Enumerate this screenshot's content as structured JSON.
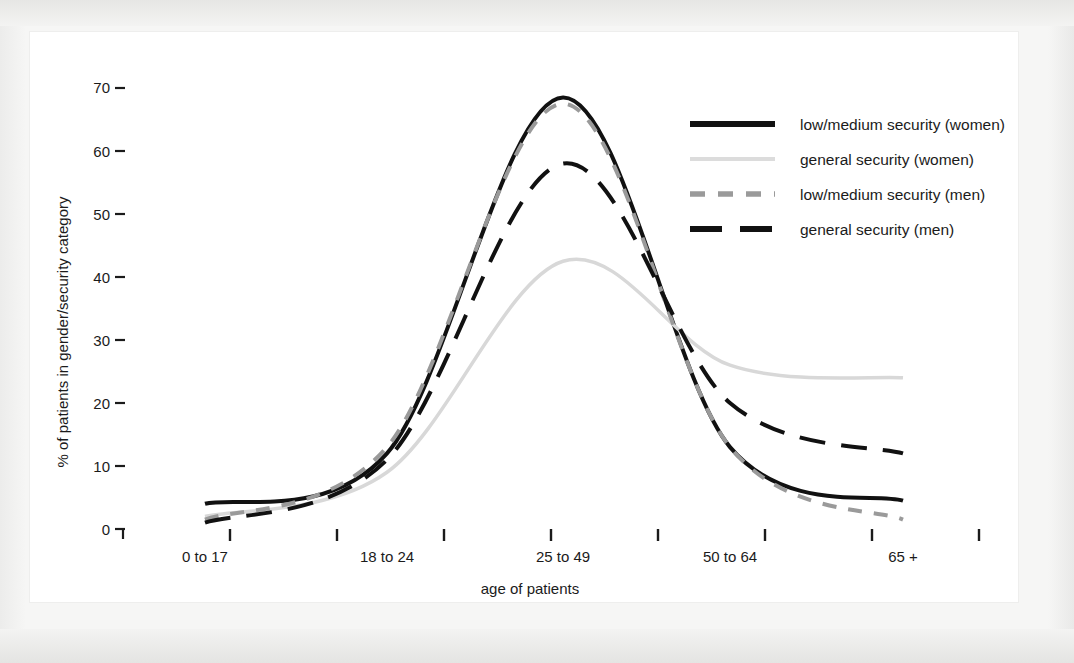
{
  "chart_data": {
    "type": "line",
    "title": "",
    "xlabel": "age of patients",
    "ylabel": "% of patients in gender/security category",
    "categories": [
      "0 to 17",
      "18 to 24",
      "25 to 49",
      "50 to 64",
      "65 +"
    ],
    "ylim": [
      0,
      72
    ],
    "yticks": [
      0,
      10,
      20,
      30,
      40,
      50,
      60,
      70
    ],
    "ytick_labels": [
      "0",
      "10",
      "20",
      "30",
      "40",
      "50",
      "60",
      "70"
    ],
    "grid": false,
    "legend_position": "top-right",
    "series": [
      {
        "name": "low/medium security (women)",
        "style": "solid",
        "color": "#111111",
        "width": 4,
        "values": [
          4,
          12,
          68.5,
          13,
          4.5
        ]
      },
      {
        "name": "general security (women)",
        "style": "solid",
        "color": "#d8d8d8",
        "width": 3.5,
        "values": [
          2,
          9,
          42.5,
          26,
          24
        ]
      },
      {
        "name": "low/medium security (men)",
        "style": "dashed",
        "color": "#9a9a9a",
        "width": 4,
        "values": [
          1.5,
          13,
          67.5,
          13,
          1.5
        ]
      },
      {
        "name": "general security (men)",
        "style": "dashed",
        "color": "#111111",
        "width": 4,
        "values": [
          1,
          11,
          58,
          20,
          12
        ]
      }
    ]
  },
  "legend": {
    "items": [
      {
        "label": "low/medium security (women)",
        "swatch": "solid-black-thick"
      },
      {
        "label": "general security (women)",
        "swatch": "solid-lightgray"
      },
      {
        "label": "low/medium security (men)",
        "swatch": "dashed-gray"
      },
      {
        "label": "general security (men)",
        "swatch": "dashed-black"
      }
    ]
  },
  "axes": {
    "y_title": "% of patients in gender/security category",
    "x_title": "age of patients",
    "y_labels": [
      "70",
      "60",
      "50",
      "40",
      "30",
      "20",
      "10",
      "0"
    ],
    "x_labels": [
      "0 to 17",
      "18 to 24",
      "25 to 49",
      "50 to 64",
      "65 +"
    ]
  },
  "colors": {
    "ink": "#111111",
    "gray_dash": "#9a9a9a",
    "light_gray": "#d8d8d8",
    "panel": "#ffffff",
    "page": "#f4f4f2"
  }
}
